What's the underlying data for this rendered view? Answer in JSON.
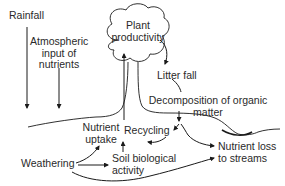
{
  "diagram": {
    "labels": {
      "rainfall": "Rainfall",
      "atmospheric_1": "Atmospheric",
      "atmospheric_2": "input of",
      "atmospheric_3": "nutrients",
      "plant_1": "Plant",
      "plant_2": "productivity",
      "litter_fall": "Litter fall",
      "decomp_1": "Decomposition of organic",
      "decomp_2": "matter",
      "uptake_1": "Nutrient",
      "uptake_2": "uptake",
      "recycling": "Recycling",
      "weathering": "Weathering",
      "soil_1": "Soil biological",
      "soil_2": "activity",
      "loss_1": "Nutrient loss",
      "loss_2": "to streams"
    },
    "colors": {
      "stroke": "#1a1a1a",
      "text": "#2a2a2a",
      "background": "#ffffff"
    }
  }
}
